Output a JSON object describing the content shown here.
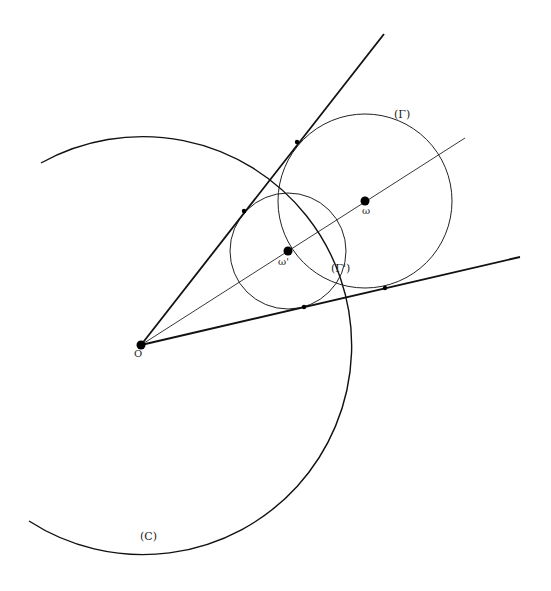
{
  "diagram": {
    "stroke_color": "#111111",
    "background": "#ffffff",
    "labels": {
      "O": "O",
      "omega": "ω",
      "omega_prime": "ω'",
      "Gamma": "(Γ)",
      "Gamma_prime": "(Γ')",
      "C": "(C)"
    },
    "points": {
      "O": {
        "x": 141,
        "y": 345
      },
      "omega": {
        "x": 365,
        "y": 201
      },
      "omega_prime": {
        "x": 288,
        "y": 251
      },
      "upper_tangent_Gamma": {
        "x": 297,
        "y": 142
      },
      "upper_tangent_Gamma_prime": {
        "x": 244,
        "y": 211
      },
      "lower_tangent_Gamma": {
        "x": 385,
        "y": 288
      },
      "lower_tangent_Gamma_prime": {
        "x": 304,
        "y": 307
      }
    },
    "circles": {
      "Gamma": {
        "cx": 365,
        "cy": 201,
        "r": 87
      },
      "Gamma_prime": {
        "cx": 288,
        "cy": 251,
        "r": 58
      },
      "C": {
        "cx": 138,
        "cy": 346,
        "r": 209
      }
    },
    "lines": {
      "upper": {
        "x1": 141,
        "y1": 345,
        "x2": 384,
        "y2": 34
      },
      "axis": {
        "x1": 141,
        "y1": 345,
        "x2": 465,
        "y2": 138
      },
      "lower": {
        "x1": 141,
        "y1": 345,
        "x2": 520,
        "y2": 257
      }
    }
  }
}
